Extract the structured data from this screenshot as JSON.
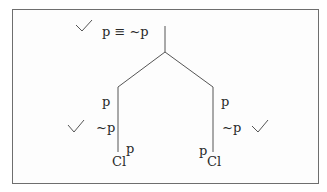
{
  "diagram": {
    "type": "truth-tree",
    "root": {
      "formula": "p ≡ ~p",
      "checked": true,
      "check_icon": "✓"
    },
    "branches": [
      {
        "side": "left",
        "lines": [
          "p",
          "~p"
        ],
        "checked": true,
        "annotation": "p",
        "closure": "Cl"
      },
      {
        "side": "right",
        "lines": [
          "p",
          "~p"
        ],
        "checked": true,
        "annotation": "p",
        "closure": "Cl"
      }
    ],
    "colors": {
      "line": "#555555",
      "text": "#2a2a2a",
      "frame": "#6e6e6e"
    }
  }
}
